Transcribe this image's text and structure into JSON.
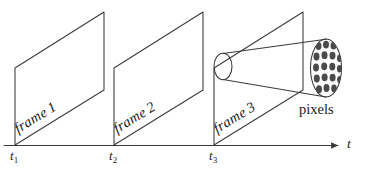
{
  "diagram": {
    "background_color": "#ffffff",
    "stroke_color": "#3a3a3a",
    "dot_fill_color": "#4a4a4a",
    "axis": {
      "label": "t",
      "ticks": [
        {
          "label": "t",
          "subscript": "1"
        },
        {
          "label": "t",
          "subscript": "2"
        },
        {
          "label": "t",
          "subscript": "3"
        }
      ]
    },
    "frames": [
      {
        "label": "frame",
        "number": "1"
      },
      {
        "label": "frame",
        "number": "2"
      },
      {
        "label": "frame",
        "number": "3"
      }
    ],
    "callout": {
      "label": "pixels",
      "grid_columns": 4,
      "grid_rows": 5
    }
  }
}
